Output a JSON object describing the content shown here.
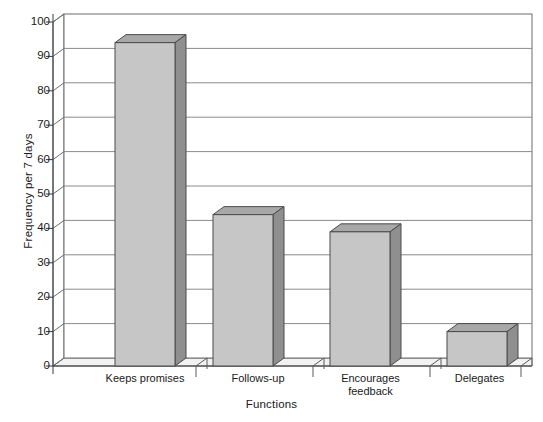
{
  "chart_data": {
    "type": "bar",
    "title": "",
    "subtitle": "",
    "xlabel": "Functions",
    "ylabel": "Frequency per 7 days",
    "categories": [
      "Keeps promises",
      "Follows-up",
      "Encourages feedback",
      "Delegates"
    ],
    "category_lines": [
      [
        "Keeps promises"
      ],
      [
        "Follows-up"
      ],
      [
        "Encourages",
        "feedback"
      ],
      [
        "Delegates"
      ]
    ],
    "values": [
      94,
      44,
      39,
      10
    ],
    "ylim": [
      0,
      100
    ],
    "ytick_labels": [
      "100",
      "90",
      "80",
      "70",
      "60",
      "50",
      "40",
      "30",
      "20",
      "10",
      "0"
    ],
    "ytick_values": [
      100,
      90,
      80,
      70,
      60,
      50,
      40,
      30,
      20,
      10,
      0
    ],
    "ytick_step": 10,
    "grid": "horizontal",
    "legend": "none",
    "style": "3d-column",
    "colors": {
      "bar_front": "#c6c6c6",
      "bar_side": "#8f8f8f",
      "bar_top": "#a8a8a8",
      "bar_outline": "#4a4a4a",
      "gridline": "#8a8a8a",
      "axis": "#3a3a3a",
      "wall": "#ffffff",
      "floor": "#e8e8e8",
      "background": "#ffffff",
      "text": "#1a1a1a"
    }
  }
}
